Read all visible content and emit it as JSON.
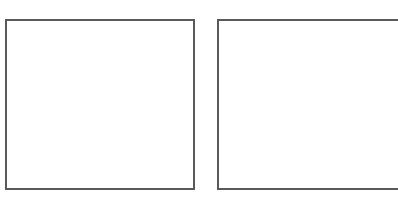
{
  "panels": [
    {
      "id": "left",
      "content": ""
    },
    {
      "id": "right",
      "content": ""
    }
  ],
  "colors": {
    "background": "#ffffff",
    "border": "#5a5a5a"
  }
}
